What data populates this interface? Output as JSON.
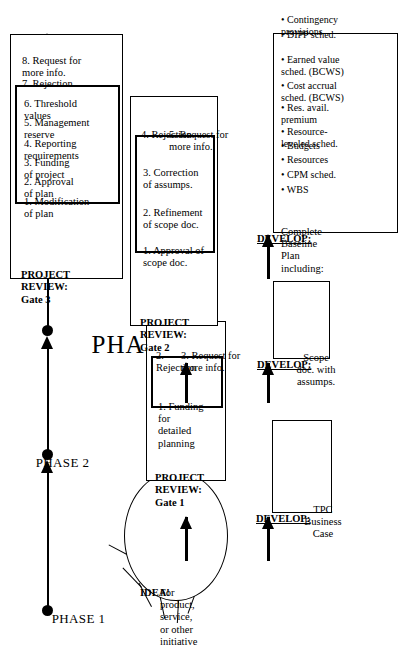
{
  "diagram": {
    "type": "flowchart"
  },
  "timeline": {
    "phases": [
      {
        "id": "phase-1",
        "label": "PHASE 1"
      },
      {
        "id": "phase-2",
        "label": "PHASE 2"
      },
      {
        "id": "phase-3",
        "label": "PHASE 3"
      }
    ]
  },
  "idea": {
    "title": "IDEA!",
    "body": "For\nproduct,\nservice,\nor other\ninitiative"
  },
  "phase1": {
    "develop": {
      "label": "DEVELOP:",
      "body": "TPC\nBusiness\nCase"
    },
    "review": {
      "header": "PROJECT\nREVIEW:\nGate 1",
      "highlighted": [
        "1. Funding for\n     detailed\n     planning"
      ],
      "other": [
        "2. Rejection",
        "3. Request for\n     more info."
      ]
    }
  },
  "phase2": {
    "develop": {
      "label": "DEVELOP:",
      "body": "Scope\ndoc. with\nassumps."
    },
    "review": {
      "header": "PROJECT\nREVIEW:\nGate 2",
      "highlighted": [
        "1. Approval of\n     scope doc.",
        "2. Refinement\n     of scope doc.",
        "3. Correction\n     of assumps."
      ],
      "other": [
        "4. Rejection",
        "5. Request for\n     more info."
      ]
    }
  },
  "phase3": {
    "develop": {
      "label": "DEVELOP:",
      "intro": "Complete\nBaseline\nPlan including:",
      "items": [
        "• WBS",
        "• CPM sched.",
        "• Resources",
        "• Budgets",
        "• Resource-\n   leveled sched.",
        "• Res. avail.\n   premium",
        "• Cost accrual\n   sched. (BCWS)",
        "• Earned value\n   sched. (BCWS)",
        "• DIPP sched.",
        "• Contingency\n   provisions"
      ]
    },
    "review": {
      "header": "PROJECT\nREVIEW:\nGate 3",
      "highlighted": [
        "1. Modification\n     of  plan",
        "2. Approval\n     of plan",
        "3. Funding\n     of project",
        "4. Reporting\n     requirements",
        "5. Management\n     reserve",
        "6. Threshold\n     values"
      ],
      "other": [
        "7. Rejection",
        "8. Request for\n     more info."
      ]
    }
  },
  "colors": {
    "ink": "#000000",
    "paper": "#ffffff"
  }
}
